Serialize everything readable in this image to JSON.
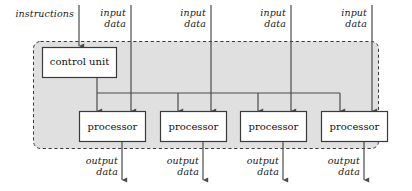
{
  "diagram": {
    "enclosure": {
      "name": "machine-boundary",
      "style": "dashed-rounded",
      "fill": "#e0e0e0",
      "stroke": "#3a3a3a"
    },
    "control_unit": {
      "label": "control unit"
    },
    "processors": [
      {
        "label": "processor"
      },
      {
        "label": "processor"
      },
      {
        "label": "processor"
      },
      {
        "label": "processor"
      }
    ],
    "instruction_input": {
      "label": "instructions"
    },
    "data_inputs": [
      {
        "line1": "input",
        "line2": "data"
      },
      {
        "line1": "input",
        "line2": "data"
      },
      {
        "line1": "input",
        "line2": "data"
      },
      {
        "line1": "input",
        "line2": "data"
      }
    ],
    "data_outputs": [
      {
        "line1": "output",
        "line2": "data"
      },
      {
        "line1": "output",
        "line2": "data"
      },
      {
        "line1": "output",
        "line2": "data"
      },
      {
        "line1": "output",
        "line2": "data"
      }
    ],
    "colors": {
      "background": "#ffffff",
      "enclosure_fill": "#e0e0e0",
      "box_fill": "#ffffff",
      "line": "#4a4a4a",
      "text": "#111111"
    }
  }
}
